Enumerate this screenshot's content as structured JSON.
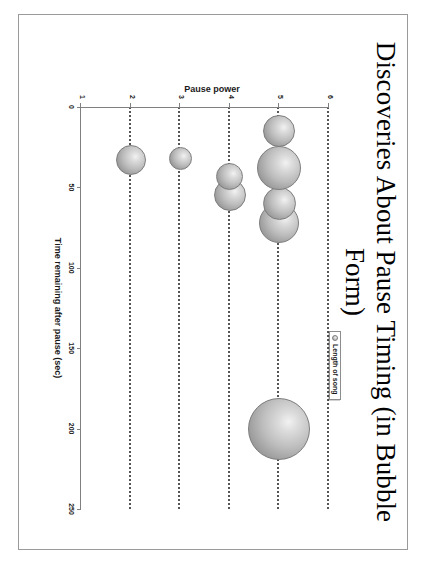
{
  "document": {
    "title": "Discoveries About Pause Timing (in Bubble Form)",
    "orientation": "rotated-90-clockwise"
  },
  "legend": {
    "marker_icon": "bubble-marker-icon",
    "label": "Length of song",
    "position": "inside-plot-upper-right"
  },
  "chart_data": {
    "type": "scatter",
    "subtype": "bubble",
    "title": "Discoveries About Pause Timing (in Bubble Form)",
    "xlabel": "Time remaining after pause (sec)",
    "ylabel": "Pause power",
    "xlim": [
      0,
      250
    ],
    "ylim": [
      1,
      6
    ],
    "xticks": [
      0,
      50,
      100,
      150,
      200,
      250
    ],
    "yticks": [
      1,
      2,
      3,
      4,
      5,
      6
    ],
    "grid": "horizontal-dotted-rows",
    "legend_position": "upper-right",
    "series": [
      {
        "name": "Length of song",
        "size_meaning": "Length of song",
        "points": [
          {
            "x": 200,
            "y": 5,
            "size": 62,
            "label": ""
          },
          {
            "x": 72,
            "y": 5,
            "size": 40,
            "label": ""
          },
          {
            "x": 60,
            "y": 5,
            "size": 33,
            "label": ""
          },
          {
            "x": 38,
            "y": 5,
            "size": 44,
            "label": ""
          },
          {
            "x": 15,
            "y": 5,
            "size": 32,
            "label": ""
          },
          {
            "x": 55,
            "y": 4,
            "size": 32,
            "label": ""
          },
          {
            "x": 43,
            "y": 4,
            "size": 27,
            "label": ""
          },
          {
            "x": 32,
            "y": 3,
            "size": 23,
            "label": ""
          },
          {
            "x": 33,
            "y": 2,
            "size": 30,
            "label": ""
          }
        ]
      }
    ]
  },
  "colors": {
    "bubble_fill_light": "#f2f2f2",
    "bubble_fill_mid": "#bdbdbd",
    "bubble_fill_dark": "#8a8a8a",
    "bubble_stroke": "#7d7d7d",
    "gridline": "#555555",
    "axis": "#808080",
    "text": "#1a1a1a",
    "page_border": "#9a9a9a",
    "background": "#ffffff"
  }
}
